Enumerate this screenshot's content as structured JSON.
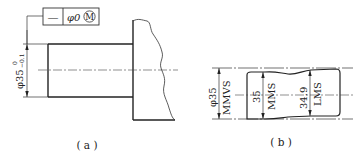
{
  "figure_a": {
    "caption": "( a )",
    "feature_control_frame": {
      "symbol": "—",
      "symbol_name": "straightness",
      "tolerance": "φ0",
      "modifier": "M",
      "modifier_name": "maximum material condition"
    },
    "dimension": {
      "nominal": "φ35",
      "upper_deviation": "0",
      "lower_deviation": "−0.1"
    }
  },
  "figure_b": {
    "caption": "( b )",
    "dimensions": [
      {
        "value": "φ35",
        "label": "MMVS"
      },
      {
        "value": "35",
        "label": "MMS"
      },
      {
        "value": "34.9",
        "label": "LMS"
      }
    ]
  }
}
